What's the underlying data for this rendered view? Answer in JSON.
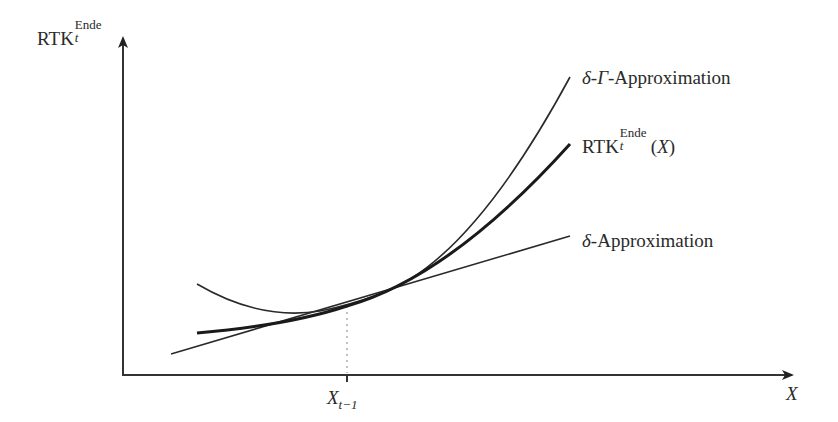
{
  "diagram": {
    "type": "function-approximation-plot",
    "y_axis": {
      "label_base": "RTK",
      "label_sub": "t",
      "label_sup": "Ende"
    },
    "x_axis": {
      "label": "X",
      "tick_label_base": "X",
      "tick_label_sub": "t−1"
    },
    "curves": [
      {
        "id": "delta-gamma",
        "label_prefix": "δ-",
        "label_greek": "Γ",
        "label_suffix": "-Approximation",
        "style": "thin solid",
        "shape": "parabola tangent at X_{t-1}"
      },
      {
        "id": "rtk",
        "label_base": "RTK",
        "label_sub": "t",
        "label_sup": "Ende",
        "label_suffix_open": "(",
        "label_var": "X",
        "label_suffix_close": ")",
        "style": "thick solid",
        "shape": "convex curve"
      },
      {
        "id": "delta",
        "label_prefix": "δ",
        "label_suffix": "-Approximation",
        "style": "thin solid",
        "shape": "tangent line at X_{t-1}"
      }
    ],
    "guide": {
      "style": "dotted",
      "from": "tangent point",
      "to": "x-axis at X_{t-1}"
    },
    "colors": {
      "line": "#222222",
      "background": "#ffffff",
      "dotted": "#999999"
    }
  }
}
